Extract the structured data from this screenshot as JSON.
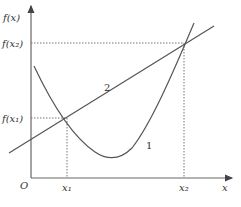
{
  "figure": {
    "y_axis_label": "f(x)",
    "x_axis_label": "x",
    "origin_label": "O",
    "y_ticks": [
      {
        "label": "f(x₂)",
        "value": "f(x2)"
      },
      {
        "label": "f(x₁)",
        "value": "f(x1)"
      }
    ],
    "x_ticks": [
      {
        "label": "x₁",
        "value": "x1"
      },
      {
        "label": "x₂",
        "value": "x2"
      }
    ],
    "curves": [
      {
        "id": "1",
        "label": "1",
        "type": "convex curve (parabola-like)"
      },
      {
        "id": "2",
        "label": "2",
        "type": "straight line"
      }
    ],
    "intersections": [
      {
        "x": "x1",
        "y": "f(x1)"
      },
      {
        "x": "x2",
        "y": "f(x2)"
      }
    ],
    "colors": {
      "line": "#555555",
      "axis": "#666666",
      "guide": "#777777"
    }
  }
}
